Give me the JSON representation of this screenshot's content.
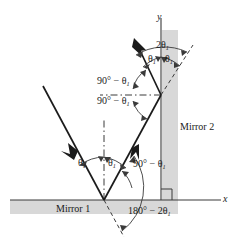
{
  "figure": {
    "kind": "optics-ray-diagram",
    "title_fragment": "",
    "background_color": "#ffffff",
    "ink_color": "#1b1b1b",
    "mirror_fill_color": "#d8d8d8",
    "axes": {
      "y_label": "y",
      "x_label": "x",
      "origin_px": [
        161,
        200
      ]
    },
    "mirrors": [
      {
        "id": "mirror-1",
        "label": "Mirror 1",
        "orientation": "horizontal"
      },
      {
        "id": "mirror-2",
        "label": "Mirror 2",
        "orientation": "vertical"
      }
    ],
    "angle_labels": {
      "incidence_mirror1": "θ",
      "reflection_mirror1": "θ",
      "normal_to_ray_mirror1": "90° − θ",
      "deviation_mirror1": "180° − 2θ",
      "upper_normal_upper": "90° − θ",
      "upper_normal_lower": "90° − θ",
      "incidence_mirror2": "θ",
      "reflection_mirror2": "θ",
      "total_deviation": "2θ"
    },
    "subscript": "1",
    "degree_sign": "°",
    "minus_sign": "−",
    "theta_glyph": "θ"
  }
}
